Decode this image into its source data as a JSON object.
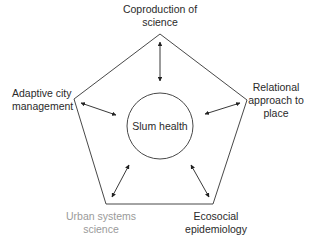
{
  "diagram": {
    "center": {
      "label": "Slum health"
    },
    "nodes": [
      {
        "id": "top",
        "lines": [
          "Coproduction of",
          "science"
        ],
        "color": "#2a2a2a"
      },
      {
        "id": "left",
        "lines": [
          "Adaptive city",
          "management"
        ],
        "color": "#2a2a2a"
      },
      {
        "id": "right",
        "lines": [
          "Relational",
          "approach to",
          "place"
        ],
        "color": "#2a2a2a"
      },
      {
        "id": "bottom-left",
        "lines": [
          "Urban systems",
          "science"
        ],
        "color": "#9a9a9a"
      },
      {
        "id": "bottom-right",
        "lines": [
          "Ecosocial",
          "epidemiology"
        ],
        "color": "#2a2a2a"
      }
    ],
    "edges": [
      {
        "from": "top",
        "to": "center",
        "type": "bidirectional"
      },
      {
        "from": "left",
        "to": "center",
        "type": "bidirectional"
      },
      {
        "from": "right",
        "to": "center",
        "type": "bidirectional"
      },
      {
        "from": "bottom-left",
        "to": "center",
        "type": "bidirectional"
      },
      {
        "from": "bottom-right",
        "to": "center",
        "type": "bidirectional"
      }
    ],
    "shape": "pentagon"
  }
}
